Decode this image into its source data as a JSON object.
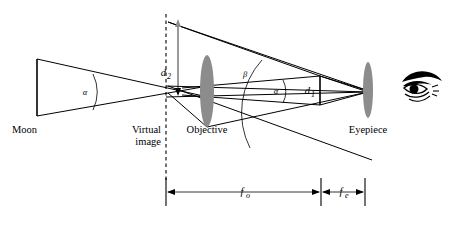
{
  "figure": {
    "width": 456,
    "height": 234,
    "background_color": "#ffffff",
    "line_color": "#000000",
    "lens_color": "#8c8c8c"
  },
  "labels": {
    "moon": "Moon",
    "virtual_image_line1": "Virtual",
    "virtual_image_line2": "image",
    "objective": "Objective",
    "eyepiece": "Eyepiece"
  },
  "symbols": {
    "alpha_left": "α",
    "alpha_right": "α",
    "beta": "β",
    "d_one_base": "d",
    "d_one_sub": "1",
    "d_two_base": "d",
    "d_two_sub": "2",
    "f_objective_base": "f",
    "f_objective_sub": "o",
    "f_eyepiece_base": "f",
    "f_eyepiece_sub": "e"
  },
  "elements": {
    "moon_object_name": "moon-object-line",
    "objective_lens_name": "objective-lens",
    "eyepiece_lens_name": "eyepiece-lens",
    "eye_name": "observer-eye",
    "optical_axis_name": "optical-axis",
    "virtual_image_plane_name": "virtual-image-dashed-line"
  },
  "geometry": {
    "moon_x": 37,
    "moon_top_y": 59,
    "moon_bottom_y": 116,
    "virtual_image_x": 166,
    "d2_arrow_x": 178,
    "objective_x": 207,
    "objective_ry": 35,
    "d1_x": 320,
    "eyepiece_x": 368,
    "eyepiece_ry": 28,
    "axis_y": 92,
    "dim_y": 192,
    "dim_left_x": 166,
    "dim_mid_x": 321,
    "dim_right_x": 365
  }
}
